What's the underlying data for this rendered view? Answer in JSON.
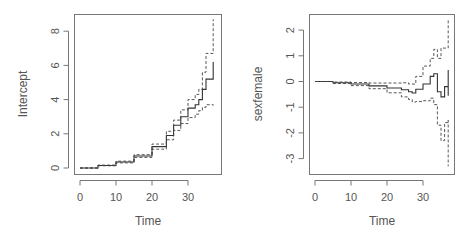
{
  "chart_data": [
    {
      "type": "line",
      "title": "",
      "xlabel": "Time",
      "ylabel": "Intercept",
      "xlim": [
        -1,
        39
      ],
      "ylim": [
        -0.5,
        9
      ],
      "x_ticks": [
        0,
        10,
        20,
        30
      ],
      "y_ticks": [
        0,
        2,
        4,
        6,
        8
      ],
      "grid": false,
      "legend": null,
      "series": [
        {
          "name": "estimate",
          "style": "solid-step",
          "x": [
            0,
            5,
            10,
            15,
            20,
            24,
            26,
            28,
            30,
            32,
            33,
            34,
            35,
            37,
            37
          ],
          "values": [
            0,
            0.15,
            0.35,
            0.7,
            1.25,
            1.9,
            2.5,
            3.0,
            3.5,
            3.7,
            4.0,
            4.6,
            5.2,
            5.2,
            6.2
          ]
        },
        {
          "name": "upper CI",
          "style": "dashed-step",
          "x": [
            0,
            5,
            10,
            15,
            20,
            24,
            26,
            28,
            30,
            32,
            33,
            34,
            35,
            37,
            37
          ],
          "values": [
            0,
            0.17,
            0.4,
            0.78,
            1.4,
            2.15,
            2.8,
            3.4,
            4.0,
            4.3,
            4.6,
            5.6,
            6.7,
            6.7,
            8.7
          ]
        },
        {
          "name": "lower CI",
          "style": "dashed-step",
          "x": [
            0,
            5,
            10,
            15,
            20,
            24,
            26,
            28,
            30,
            32,
            33,
            34,
            35,
            37
          ],
          "values": [
            0,
            0.13,
            0.3,
            0.62,
            1.1,
            1.65,
            2.2,
            2.6,
            2.95,
            3.15,
            3.35,
            3.55,
            3.7,
            3.65
          ]
        }
      ]
    },
    {
      "type": "line",
      "title": "",
      "xlabel": "Time",
      "ylabel": "sexfemale",
      "xlim": [
        -1,
        39
      ],
      "ylim": [
        -3.5,
        2.5
      ],
      "x_ticks": [
        0,
        10,
        20,
        30
      ],
      "y_ticks": [
        -3,
        -2,
        -1,
        0,
        1,
        2
      ],
      "grid": false,
      "legend": null,
      "series": [
        {
          "name": "estimate",
          "style": "solid-step",
          "x": [
            0,
            5,
            10,
            15,
            20,
            24,
            26,
            27,
            28,
            30,
            32,
            33,
            34,
            35,
            36,
            37,
            37
          ],
          "values": [
            0,
            -0.05,
            -0.1,
            -0.17,
            -0.25,
            -0.32,
            -0.4,
            -0.45,
            -0.3,
            -0.1,
            0.2,
            0.3,
            -0.4,
            -0.6,
            -0.2,
            0.45,
            -0.55
          ]
        },
        {
          "name": "upper CI",
          "style": "dashed-step",
          "x": [
            0,
            5,
            10,
            15,
            20,
            24,
            26,
            28,
            30,
            32,
            33,
            34,
            35,
            37
          ],
          "values": [
            0,
            -0.02,
            -0.04,
            -0.06,
            -0.06,
            -0.05,
            -0.1,
            0.2,
            0.6,
            0.9,
            1.25,
            0.9,
            1.3,
            2.4
          ]
        },
        {
          "name": "lower CI",
          "style": "dashed-step",
          "x": [
            0,
            5,
            10,
            15,
            20,
            24,
            26,
            27,
            28,
            30,
            32,
            33,
            34,
            35,
            36,
            37,
            37
          ],
          "values": [
            0,
            -0.08,
            -0.16,
            -0.28,
            -0.44,
            -0.6,
            -0.7,
            -0.8,
            -0.78,
            -0.75,
            -0.65,
            -0.9,
            -1.7,
            -2.3,
            -1.6,
            -1.5,
            -3.3
          ]
        }
      ]
    }
  ],
  "panels": [
    {
      "ylabel": "Intercept",
      "xlabel": "Time",
      "x_tick_labels": [
        "0",
        "10",
        "20",
        "30"
      ],
      "y_tick_labels": [
        "0",
        "2",
        "4",
        "6",
        "8"
      ]
    },
    {
      "ylabel": "sexfemale",
      "xlabel": "Time",
      "x_tick_labels": [
        "0",
        "10",
        "20",
        "30"
      ],
      "y_tick_labels": [
        "-3",
        "-2",
        "-1",
        "0",
        "1",
        "2"
      ]
    }
  ]
}
